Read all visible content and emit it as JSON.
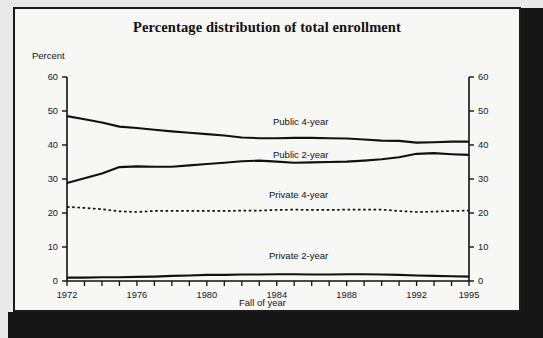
{
  "figure": {
    "title": "Percentage distribution of total enrollment",
    "y_axis_label": "Percent",
    "x_axis_label": "Fall of year"
  },
  "chart_data": {
    "type": "line",
    "title": "Percentage distribution of total enrollment",
    "xlabel": "Fall of year",
    "ylabel": "Percent",
    "xlim": [
      1972,
      1995
    ],
    "ylim": [
      0,
      60
    ],
    "y_ticks": [
      0,
      10,
      20,
      30,
      40,
      50,
      60
    ],
    "x_ticks": [
      1972,
      1973,
      1974,
      1975,
      1976,
      1977,
      1978,
      1979,
      1980,
      1981,
      1982,
      1983,
      1984,
      1985,
      1986,
      1987,
      1988,
      1989,
      1990,
      1991,
      1992,
      1993,
      1994,
      1995
    ],
    "x_tick_labels": [
      "1972",
      "",
      "",
      "",
      "1976",
      "",
      "",
      "",
      "1980",
      "",
      "",
      "",
      "1984",
      "",
      "",
      "",
      "1988",
      "",
      "",
      "",
      "1992",
      "",
      "",
      "1995"
    ],
    "grid": false,
    "legend": "inline-labels",
    "dual_y_axis": true,
    "x": [
      1972,
      1973,
      1974,
      1975,
      1976,
      1977,
      1978,
      1979,
      1980,
      1981,
      1982,
      1983,
      1984,
      1985,
      1986,
      1987,
      1988,
      1989,
      1990,
      1991,
      1992,
      1993,
      1994,
      1995
    ],
    "series": [
      {
        "name": "Public 4-year",
        "style": "solid",
        "label_x": 1984.0,
        "label_y": 45.5,
        "values": [
          48.5,
          47.6,
          46.6,
          45.4,
          45.0,
          44.5,
          44.0,
          43.6,
          43.2,
          42.8,
          42.2,
          42.0,
          42.0,
          42.1,
          42.1,
          42.0,
          41.9,
          41.6,
          41.3,
          41.2,
          40.7,
          40.8,
          41.0,
          41.0
        ]
      },
      {
        "name": "Public 2-year",
        "style": "solid",
        "label_x": 1984.0,
        "label_y": 39.4,
        "values": [
          28.8,
          30.2,
          31.6,
          33.5,
          33.7,
          33.6,
          33.6,
          34.0,
          34.4,
          34.8,
          35.2,
          35.4,
          35.1,
          34.8,
          34.9,
          35.0,
          35.1,
          35.4,
          35.8,
          36.4,
          37.4,
          37.6,
          37.3,
          37.1
        ]
      },
      {
        "name": "Private 4-year",
        "style": "dashed",
        "label_x": 1984.0,
        "label_y": 24.4,
        "values": [
          21.8,
          21.5,
          21.1,
          20.5,
          20.3,
          20.6,
          20.6,
          20.6,
          20.6,
          20.6,
          20.7,
          20.7,
          20.9,
          21.0,
          20.9,
          20.9,
          21.0,
          21.0,
          21.0,
          20.6,
          20.3,
          20.4,
          20.6,
          20.7
        ]
      },
      {
        "name": "Private 2-year",
        "style": "solid",
        "label_x": 1984.0,
        "label_y": 8.0,
        "values": [
          1.0,
          1.0,
          1.1,
          1.1,
          1.2,
          1.3,
          1.5,
          1.6,
          1.8,
          1.8,
          1.9,
          1.9,
          2.0,
          2.0,
          1.9,
          1.9,
          2.0,
          2.0,
          1.9,
          1.8,
          1.6,
          1.5,
          1.4,
          1.3
        ]
      }
    ]
  }
}
